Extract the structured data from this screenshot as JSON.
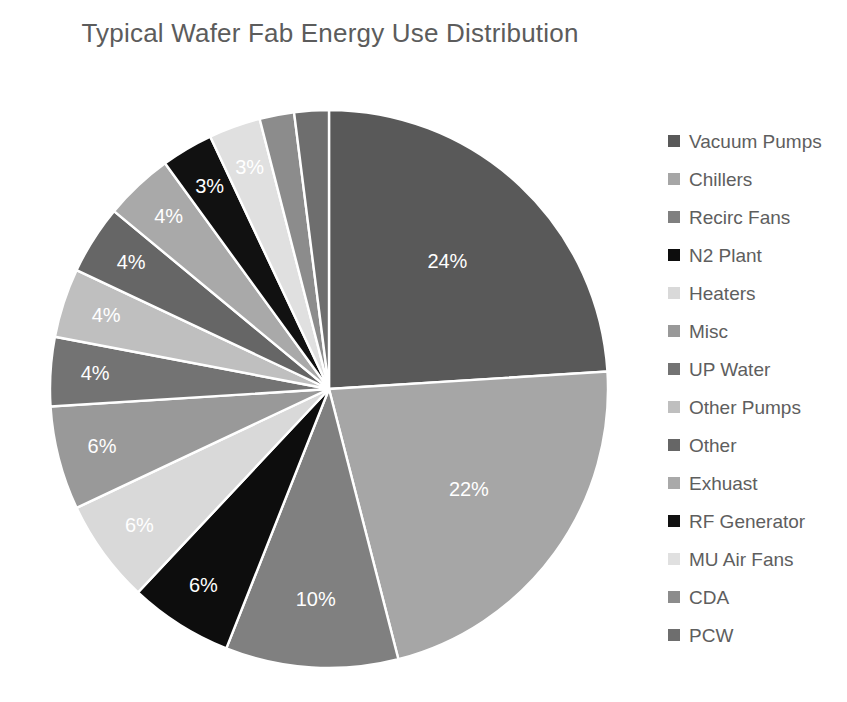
{
  "chart_title": "Typical Wafer Fab Energy Use Distribution",
  "chart_data": {
    "type": "pie",
    "title": "Typical Wafer Fab Energy Use Distribution",
    "legend_position": "right",
    "grid": false,
    "unit": "%",
    "categories": [
      "Vacuum Pumps",
      "Chillers",
      "Recirc Fans",
      "N2 Plant",
      "Heaters",
      "Misc",
      "UP Water",
      "Other Pumps",
      "Other",
      "Exhuast",
      "RF Generator",
      "MU Air Fans",
      "CDA",
      "PCW"
    ],
    "values": [
      24,
      22,
      10,
      6,
      6,
      6,
      4,
      4,
      4,
      4,
      3,
      3,
      2,
      2
    ],
    "data_labels": [
      "24%",
      "22%",
      "10%",
      "6%",
      "6%",
      "6%",
      "4%",
      "4%",
      "4%",
      "4%",
      "3%",
      "3%",
      "",
      ""
    ],
    "colors": [
      "#595959",
      "#a6a6a6",
      "#808080",
      "#0d0d0d",
      "#d9d9d9",
      "#999999",
      "#737373",
      "#bfbfbf",
      "#666666",
      "#a9a9a9",
      "#111111",
      "#e0e0e0",
      "#8c8c8c",
      "#6e6e6e"
    ],
    "slices": [
      {
        "label": "Vacuum Pumps",
        "value": 24,
        "data_label": "24%",
        "color": "#595959"
      },
      {
        "label": "Chillers",
        "value": 22,
        "data_label": "22%",
        "color": "#a6a6a6"
      },
      {
        "label": "Recirc Fans",
        "value": 10,
        "data_label": "10%",
        "color": "#808080"
      },
      {
        "label": "N2 Plant",
        "value": 6,
        "data_label": "6%",
        "color": "#0d0d0d"
      },
      {
        "label": "Heaters",
        "value": 6,
        "data_label": "6%",
        "color": "#d9d9d9"
      },
      {
        "label": "Misc",
        "value": 6,
        "data_label": "6%",
        "color": "#999999"
      },
      {
        "label": "UP Water",
        "value": 4,
        "data_label": "4%",
        "color": "#737373"
      },
      {
        "label": "Other Pumps",
        "value": 4,
        "data_label": "4%",
        "color": "#bfbfbf"
      },
      {
        "label": "Other",
        "value": 4,
        "data_label": "4%",
        "color": "#666666"
      },
      {
        "label": "Exhuast",
        "value": 4,
        "data_label": "4%",
        "color": "#a9a9a9"
      },
      {
        "label": "RF Generator",
        "value": 3,
        "data_label": "3%",
        "color": "#111111"
      },
      {
        "label": "MU Air Fans",
        "value": 3,
        "data_label": "3%",
        "color": "#e0e0e0"
      },
      {
        "label": "CDA",
        "value": 2,
        "data_label": "",
        "color": "#8c8c8c"
      },
      {
        "label": "PCW",
        "value": 2,
        "data_label": "",
        "color": "#6e6e6e"
      }
    ]
  },
  "legend": {
    "items": [
      {
        "label": "Vacuum Pumps",
        "color": "#595959"
      },
      {
        "label": "Chillers",
        "color": "#a6a6a6"
      },
      {
        "label": "Recirc Fans",
        "color": "#808080"
      },
      {
        "label": "N2 Plant",
        "color": "#0d0d0d"
      },
      {
        "label": "Heaters",
        "color": "#d9d9d9"
      },
      {
        "label": "Misc",
        "color": "#999999"
      },
      {
        "label": "UP Water",
        "color": "#737373"
      },
      {
        "label": "Other Pumps",
        "color": "#bfbfbf"
      },
      {
        "label": "Other",
        "color": "#666666"
      },
      {
        "label": "Exhuast",
        "color": "#a9a9a9"
      },
      {
        "label": "RF Generator",
        "color": "#111111"
      },
      {
        "label": "MU Air Fans",
        "color": "#e0e0e0"
      },
      {
        "label": "CDA",
        "color": "#8c8c8c"
      },
      {
        "label": "PCW",
        "color": "#6e6e6e"
      }
    ]
  }
}
